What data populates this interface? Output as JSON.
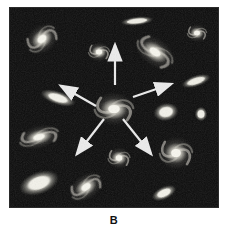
{
  "figure": {
    "label": "B",
    "colors": {
      "page_background": "#ffffff",
      "space_background": "#0b0b0b",
      "galaxy_light": "#f2f1e8",
      "arrow": "#ececec",
      "label_text": "#111111"
    }
  },
  "scene": {
    "frame": {
      "x": 10,
      "y": 8,
      "width": 208,
      "height": 199
    },
    "galaxies": [
      {
        "id": "top-edge-on",
        "type": "edge-on",
        "x": 127,
        "y": 13,
        "w": 34,
        "h": 10,
        "rot": -6
      },
      {
        "id": "top-left-spiral",
        "type": "spiral",
        "x": 32,
        "y": 31,
        "w": 37,
        "h": 31,
        "rot": -40
      },
      {
        "id": "top-middle-spiral",
        "type": "spiral",
        "x": 89,
        "y": 44,
        "w": 24,
        "h": 22,
        "rot": 0
      },
      {
        "id": "top-right-large-spiral",
        "type": "spiral",
        "x": 145,
        "y": 44,
        "w": 46,
        "h": 31,
        "rot": 35
      },
      {
        "id": "top-right-small-spiral",
        "type": "spiral",
        "x": 187,
        "y": 25,
        "w": 22,
        "h": 20,
        "rot": 0
      },
      {
        "id": "right-edge-on",
        "type": "edge-on",
        "x": 186,
        "y": 73,
        "w": 31,
        "h": 13,
        "rot": -18
      },
      {
        "id": "left-elliptical",
        "type": "elliptical",
        "x": 48,
        "y": 90,
        "w": 38,
        "h": 15,
        "rot": 18
      },
      {
        "id": "central-spiral",
        "type": "spiral",
        "x": 104,
        "y": 101,
        "w": 44,
        "h": 37,
        "rot": 0
      },
      {
        "id": "right-elliptical",
        "type": "elliptical",
        "x": 156,
        "y": 104,
        "w": 26,
        "h": 20,
        "rot": -10
      },
      {
        "id": "far-right-round",
        "type": "elliptical",
        "x": 191,
        "y": 106,
        "w": 13,
        "h": 16,
        "rot": 0
      },
      {
        "id": "left-mid-spiral",
        "type": "spiral",
        "x": 29,
        "y": 129,
        "w": 45,
        "h": 26,
        "rot": -15
      },
      {
        "id": "bottom-left-elliptical",
        "type": "elliptical",
        "x": 29,
        "y": 175,
        "w": 43,
        "h": 25,
        "rot": -20
      },
      {
        "id": "bottom-left-spiral",
        "type": "spiral",
        "x": 76,
        "y": 179,
        "w": 38,
        "h": 28,
        "rot": -35
      },
      {
        "id": "bottom-center-spiral",
        "type": "spiral",
        "x": 109,
        "y": 150,
        "w": 25,
        "h": 24,
        "rot": 0
      },
      {
        "id": "bottom-right-spiral",
        "type": "spiral",
        "x": 166,
        "y": 145,
        "w": 37,
        "h": 37,
        "rot": 0
      },
      {
        "id": "bottom-right-fuzzy",
        "type": "elliptical",
        "x": 154,
        "y": 185,
        "w": 27,
        "h": 14,
        "rot": -25
      }
    ],
    "arrows": [
      {
        "id": "arrow-up",
        "x1": 105,
        "y1": 77,
        "x2": 105,
        "y2": 37
      },
      {
        "id": "arrow-upper-left",
        "x1": 86,
        "y1": 98,
        "x2": 51,
        "y2": 78
      },
      {
        "id": "arrow-upper-right",
        "x1": 123,
        "y1": 89,
        "x2": 161,
        "y2": 76
      },
      {
        "id": "arrow-lower-left",
        "x1": 94,
        "y1": 111,
        "x2": 67,
        "y2": 146
      },
      {
        "id": "arrow-lower-right",
        "x1": 113,
        "y1": 111,
        "x2": 141,
        "y2": 146
      }
    ]
  }
}
